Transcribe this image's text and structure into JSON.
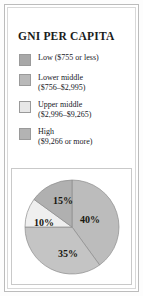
{
  "chart_title": "GNI PER CAPITA",
  "legend": {
    "items": [
      {
        "id": "low",
        "label": "Low  ($755 or less)",
        "color": "#a8a8a8",
        "swatch_name": "legend-swatch-low"
      },
      {
        "id": "lower-middle",
        "label": "Lower middle\n($756–$2,995)",
        "color": "#b9b9b9",
        "swatch_name": "legend-swatch-lower-middle"
      },
      {
        "id": "upper-middle",
        "label": "Upper middle\n($2,996–$9,265)",
        "color": "#e7e7e7",
        "swatch_name": "legend-swatch-upper-middle"
      },
      {
        "id": "high",
        "label": "High\n($9,266 or more)",
        "color": "#b3b3b3",
        "swatch_name": "legend-swatch-high"
      }
    ]
  },
  "chart_data": {
    "type": "pie",
    "title": "GNI PER CAPITA",
    "xlabel": "",
    "ylabel": "",
    "legend_position": "top",
    "grid": false,
    "start_angle_deg": 0,
    "direction": "clockwise",
    "categories": [
      "Low  ($755 or less)",
      "Lower middle ($756–$2,995)",
      "Upper middle ($2,996–$9,265)",
      "High ($9,266 or more)"
    ],
    "values": [
      40,
      35,
      10,
      15
    ],
    "value_labels": [
      "40%",
      "35%",
      "10%",
      "15%"
    ],
    "slice_colors": [
      "#bcbcbc",
      "#c4c4c4",
      "#efefef",
      "#b0b0b0"
    ],
    "units": "percent",
    "total": 100,
    "slices": [
      {
        "label": "40%",
        "value": 40,
        "category": "Low  ($755 or less)",
        "color": "#bcbcbc",
        "start_deg": 0,
        "end_deg": 144,
        "label_x": 66,
        "label_y": 44
      },
      {
        "label": "35%",
        "value": 35,
        "category": "Lower middle ($756–$2,995)",
        "color": "#c4c4c4",
        "start_deg": 144,
        "end_deg": 270,
        "label_x": 44,
        "label_y": 78
      },
      {
        "label": "10%",
        "value": 10,
        "category": "Upper middle ($2,996–$9,265)",
        "color": "#efefef",
        "start_deg": 270,
        "end_deg": 306,
        "label_x": 20,
        "label_y": 47
      },
      {
        "label": "15%",
        "value": 15,
        "category": "High ($9,266 or more)",
        "color": "#b0b0b0",
        "start_deg": 306,
        "end_deg": 360,
        "label_x": 39,
        "label_y": 25
      }
    ]
  }
}
